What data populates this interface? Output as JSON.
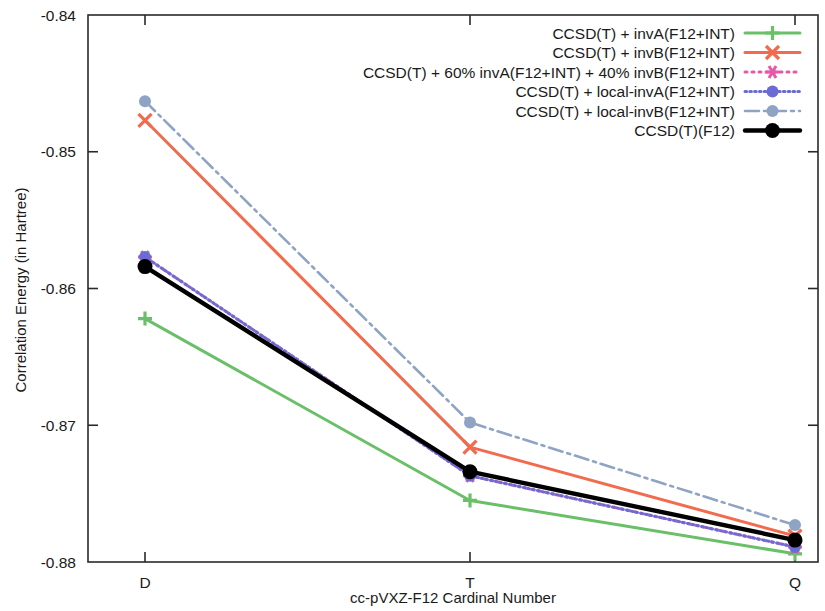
{
  "chart_data": {
    "type": "line",
    "title": "",
    "xlabel": "cc-pVXZ-F12 Cardinal Number",
    "ylabel": "Correlation Energy (in Hartree)",
    "categories": [
      "D",
      "T",
      "Q"
    ],
    "x_tick_labels": [
      "D",
      "T",
      "Q"
    ],
    "y_tick_labels": [
      "-0.84",
      "-0.85",
      "-0.86",
      "-0.87",
      "-0.88"
    ],
    "y_ticks": [
      -0.84,
      -0.85,
      -0.86,
      -0.87,
      -0.88
    ],
    "ylim": [
      -0.88,
      -0.84
    ],
    "grid": false,
    "legend_position": "top-right",
    "series": [
      {
        "name": "CCSD(T) + invA(F12+INT)",
        "color": "#6abf69",
        "style": "solid",
        "marker": "plus",
        "values": [
          -0.8622,
          -0.8755,
          -0.8794
        ]
      },
      {
        "name": "CCSD(T) + invB(F12+INT)",
        "color": "#f26b4e",
        "style": "solid",
        "marker": "cross",
        "values": [
          -0.8477,
          -0.8716,
          -0.8781
        ]
      },
      {
        "name": "CCSD(T) + 60% invA(F12+INT) + 40% invB(F12+INT)",
        "color": "#e858a8",
        "style": "dotted",
        "marker": "star",
        "values": [
          -0.8577,
          -0.8737,
          -0.8789
        ]
      },
      {
        "name": "CCSD(T) + local-invA(F12+INT)",
        "color": "#6b6bd6",
        "style": "fine-dotted",
        "marker": "circle",
        "values": [
          -0.8577,
          -0.8737,
          -0.8789
        ]
      },
      {
        "name": "CCSD(T) + local-invB(F12+INT)",
        "color": "#8fa4c4",
        "style": "dashdot",
        "marker": "circle",
        "values": [
          -0.8463,
          -0.8698,
          -0.8773
        ]
      },
      {
        "name": "CCSD(T)(F12)",
        "color": "#000000",
        "style": "solid",
        "marker": "circle",
        "values": [
          -0.8584,
          -0.8734,
          -0.8784
        ]
      }
    ]
  },
  "axes": {
    "y_axis_label": "Correlation Energy (in Hartree)",
    "x_axis_label": "cc-pVXZ-F12 Cardinal Number"
  }
}
